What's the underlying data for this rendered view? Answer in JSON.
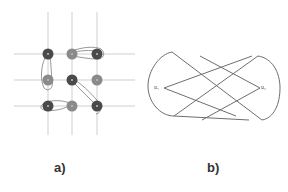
{
  "figure": {
    "panel_a": {
      "caption": "a)",
      "grid": {
        "columns_x": [
          48,
          72,
          97
        ],
        "rows_y": [
          54,
          80,
          106
        ],
        "line_color": "#c8c8c8"
      },
      "nodes": [
        {
          "row": 0,
          "col": 0,
          "shade": "dark"
        },
        {
          "row": 0,
          "col": 1,
          "shade": "medium"
        },
        {
          "row": 0,
          "col": 2,
          "shade": "dark"
        },
        {
          "row": 1,
          "col": 0,
          "shade": "medium"
        },
        {
          "row": 1,
          "col": 1,
          "shade": "dark"
        },
        {
          "row": 1,
          "col": 2,
          "shade": "medium"
        },
        {
          "row": 2,
          "col": 0,
          "shade": "dark"
        },
        {
          "row": 2,
          "col": 1,
          "shade": "medium"
        },
        {
          "row": 2,
          "col": 2,
          "shade": "dark"
        }
      ],
      "colors": {
        "dark": "#4a4a4a",
        "medium": "#8a8a8a",
        "loop": "#9a9a9a"
      }
    },
    "panel_b": {
      "caption": "b)",
      "left_label": "u₁",
      "right_label": "u₂",
      "stroke_color": "#6e6e6e"
    }
  }
}
